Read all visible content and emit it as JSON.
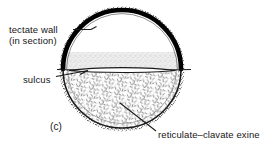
{
  "figure": {
    "panel_label": "(c)",
    "labels": {
      "tectate_wall_line1": "tectate wall",
      "tectate_wall_line2": "(in section)",
      "sulcus": "sulcus",
      "exine": "reticulate–clavate exine"
    },
    "parts": {
      "tectate_wall": "tectate-wall",
      "sulcus": "sulcus",
      "exine": "reticulate-clavate-exine",
      "granular_band": "granular-band"
    },
    "colors": {
      "ink": "#171717",
      "wall_black": "#000000",
      "stipple_gray": "#9a9a9a",
      "band_gray": "#cfcfcf",
      "background": "#ffffff"
    },
    "geometry": {
      "center_x": 122,
      "center_y": 69,
      "radius_x": 59,
      "radius_y": 59
    }
  }
}
